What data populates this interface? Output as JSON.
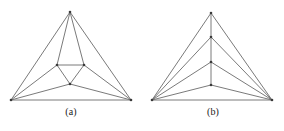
{
  "figure": {
    "background_color": "#ffffff",
    "edge_color": "#6b6b6b",
    "node_color": "#3a3a3a",
    "caption_color": "#1a1a1a",
    "panels": [
      {
        "id": "a",
        "caption": "(a)",
        "nodes": [
          {
            "name": "apex",
            "x": 70,
            "y": 12
          },
          {
            "name": "bottom-left",
            "x": 11,
            "y": 100
          },
          {
            "name": "bottom-right",
            "x": 131,
            "y": 100
          },
          {
            "name": "inner-top-left",
            "x": 57,
            "y": 65
          },
          {
            "name": "inner-top-right",
            "x": 84,
            "y": 65
          },
          {
            "name": "inner-bottom",
            "x": 70,
            "y": 84
          }
        ],
        "edges": [
          [
            "apex",
            "bottom-left"
          ],
          [
            "apex",
            "bottom-right"
          ],
          [
            "bottom-left",
            "bottom-right"
          ],
          [
            "apex",
            "inner-top-left"
          ],
          [
            "apex",
            "inner-top-right"
          ],
          [
            "inner-top-left",
            "inner-top-right"
          ],
          [
            "inner-top-left",
            "inner-bottom"
          ],
          [
            "inner-top-right",
            "inner-bottom"
          ],
          [
            "inner-top-left",
            "bottom-left"
          ],
          [
            "inner-top-right",
            "bottom-right"
          ],
          [
            "inner-bottom",
            "bottom-left"
          ],
          [
            "inner-bottom",
            "bottom-right"
          ]
        ]
      },
      {
        "id": "b",
        "caption": "(b)",
        "nodes": [
          {
            "name": "apex",
            "x": 69,
            "y": 13
          },
          {
            "name": "bottom-left",
            "x": 10,
            "y": 100
          },
          {
            "name": "bottom-right",
            "x": 130,
            "y": 100
          },
          {
            "name": "chain-1",
            "x": 69,
            "y": 37
          },
          {
            "name": "chain-2",
            "x": 69,
            "y": 62
          },
          {
            "name": "chain-3",
            "x": 69,
            "y": 85
          }
        ],
        "edges": [
          [
            "apex",
            "bottom-left"
          ],
          [
            "apex",
            "bottom-right"
          ],
          [
            "bottom-left",
            "bottom-right"
          ],
          [
            "apex",
            "chain-1"
          ],
          [
            "chain-1",
            "chain-2"
          ],
          [
            "chain-2",
            "chain-3"
          ],
          [
            "chain-1",
            "bottom-left"
          ],
          [
            "chain-1",
            "bottom-right"
          ],
          [
            "chain-2",
            "bottom-left"
          ],
          [
            "chain-2",
            "bottom-right"
          ],
          [
            "chain-3",
            "bottom-left"
          ],
          [
            "chain-3",
            "bottom-right"
          ]
        ]
      }
    ]
  }
}
